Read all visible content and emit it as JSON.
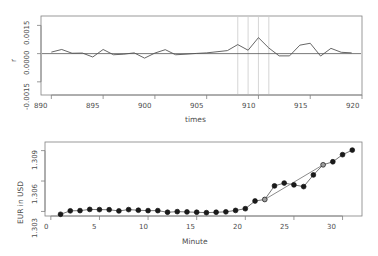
{
  "figure": {
    "background": "#ffffff",
    "line_color": "#555555",
    "axis_color": "#808080",
    "text_color": "#4d4d4d",
    "vline_color": "#d9d9d9",
    "point_fill": "#1a1a1a",
    "highlight_fill": "#9e9e9e",
    "trend_color": "#8c8c8c"
  },
  "chart_data": [
    {
      "type": "line",
      "panel": "top",
      "title": "",
      "xlabel": "times",
      "ylabel": "r",
      "xlim": [
        889.0,
        920.0
      ],
      "ylim": [
        -0.0022,
        0.002
      ],
      "grid": false,
      "legend": null,
      "xticks": [
        890,
        895,
        900,
        905,
        910,
        915,
        920
      ],
      "xticklabels": [
        "890",
        "895",
        "900",
        "905",
        "910",
        "915",
        "920"
      ],
      "yticks": [
        0.0015,
        0.0,
        -0.0015
      ],
      "yticklabels": [
        "0.0015",
        "0.0000",
        "-0.0015"
      ],
      "hline": 0.0,
      "vlines": [
        908,
        909,
        910,
        911
      ],
      "x": [
        890,
        891,
        892,
        893,
        894,
        895,
        896,
        897,
        898,
        899,
        900,
        901,
        902,
        903,
        904,
        905,
        906,
        907,
        908,
        909,
        910,
        911,
        912,
        913,
        914,
        915,
        916,
        917,
        918,
        919
      ],
      "values": [
        8e-05,
        0.00022,
        2e-05,
        3e-05,
        -0.00018,
        0.00022,
        -6e-05,
        -3e-05,
        4e-05,
        -0.00024,
        3e-05,
        0.00021,
        -6e-05,
        -3e-05,
        1e-05,
        4e-05,
        0.0001,
        0.00016,
        0.00048,
        0.00018,
        0.00085,
        0.0003,
        -0.00012,
        -0.00012,
        0.00045,
        0.00055,
        -0.00013,
        0.00028,
        7e-05,
        4e-05
      ]
    },
    {
      "type": "scatter",
      "panel": "bottom",
      "title": "",
      "xlabel": "Minute",
      "ylabel": "EUR in USD",
      "xlim": [
        -0.6,
        32.0
      ],
      "ylim": [
        1.30255,
        1.30985
      ],
      "grid": false,
      "legend": null,
      "xticks": [
        0,
        5,
        10,
        15,
        20,
        25,
        30
      ],
      "xticklabels": [
        "0",
        "5",
        "10",
        "15",
        "20",
        "25",
        "30"
      ],
      "yticks": [
        1.303,
        1.306,
        1.309
      ],
      "yticklabels": [
        "1.303",
        "1.306",
        "1.309"
      ],
      "x": [
        1,
        2,
        3,
        4,
        5,
        6,
        7,
        8,
        9,
        10,
        11,
        12,
        13,
        14,
        15,
        16,
        17,
        18,
        19,
        20,
        21,
        22,
        23,
        24,
        25,
        26,
        27,
        28,
        29,
        30,
        31
      ],
      "values": [
        1.30272,
        1.30306,
        1.30308,
        1.3032,
        1.30318,
        1.30317,
        1.30305,
        1.30318,
        1.30312,
        1.30308,
        1.30308,
        1.30292,
        1.30298,
        1.30295,
        1.30292,
        1.30288,
        1.30292,
        1.30296,
        1.3031,
        1.30327,
        1.30403,
        1.30418,
        1.30552,
        1.3058,
        1.30562,
        1.30545,
        1.3066,
        1.3076,
        1.3079,
        1.3086,
        1.30905
      ],
      "highlighted_points": [
        22,
        28
      ],
      "trend_segment": {
        "x": [
          22,
          28
        ],
        "y": [
          1.30418,
          1.3076
        ]
      }
    }
  ]
}
